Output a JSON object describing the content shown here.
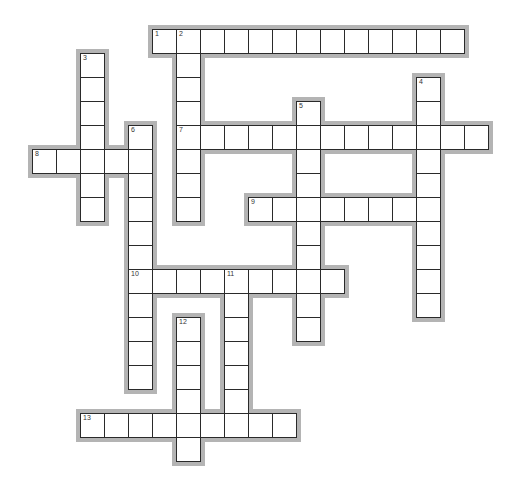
{
  "puzzle": {
    "type": "crossword",
    "grid": {
      "origin_x": 32,
      "origin_y": 29,
      "cell_size": 24,
      "rows": 18,
      "cols": 19
    },
    "colors": {
      "cell_bg": "#ffffff",
      "cell_border": "#2a2a2a",
      "outline": "#b4b4b4",
      "page_bg": "#ffffff"
    },
    "words": [
      {
        "number": "1",
        "direction": "across",
        "row": 0,
        "col": 5,
        "length": 13
      },
      {
        "number": "2",
        "direction": "down",
        "row": 0,
        "col": 6,
        "length": 8
      },
      {
        "number": "3",
        "direction": "down",
        "row": 1,
        "col": 2,
        "length": 7
      },
      {
        "number": "4",
        "direction": "down",
        "row": 2,
        "col": 16,
        "length": 10
      },
      {
        "number": "5",
        "direction": "down",
        "row": 3,
        "col": 11,
        "length": 10
      },
      {
        "number": "6",
        "direction": "down",
        "row": 4,
        "col": 4,
        "length": 11
      },
      {
        "number": "7",
        "direction": "across",
        "row": 4,
        "col": 6,
        "length": 13
      },
      {
        "number": "8",
        "direction": "across",
        "row": 5,
        "col": 0,
        "length": 5
      },
      {
        "number": "9",
        "direction": "across",
        "row": 7,
        "col": 9,
        "length": 8
      },
      {
        "number": "10",
        "direction": "across",
        "row": 10,
        "col": 4,
        "length": 9
      },
      {
        "number": "11",
        "direction": "down",
        "row": 10,
        "col": 8,
        "length": 7
      },
      {
        "number": "12",
        "direction": "down",
        "row": 12,
        "col": 6,
        "length": 6
      },
      {
        "number": "13",
        "direction": "across",
        "row": 16,
        "col": 2,
        "length": 9
      }
    ]
  }
}
